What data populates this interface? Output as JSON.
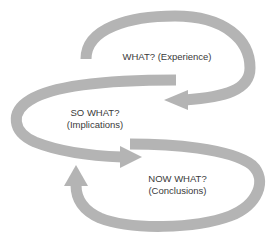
{
  "diagram": {
    "type": "cyclic reflection model",
    "arrow_color": "#b4b4b4",
    "text_color": "#3a3a3a",
    "stages": [
      {
        "id": "what",
        "title": "WHAT?",
        "subtitle": "(Experience)"
      },
      {
        "id": "so-what",
        "title": "SO WHAT?",
        "subtitle": "(Implications)"
      },
      {
        "id": "now-what",
        "title": "NOW WHAT?",
        "subtitle": "(Conclusions)"
      }
    ],
    "flow": [
      {
        "from": "what",
        "to": "so-what"
      },
      {
        "from": "so-what",
        "to": "now-what"
      },
      {
        "from": "now-what",
        "to": "so-what"
      }
    ]
  }
}
